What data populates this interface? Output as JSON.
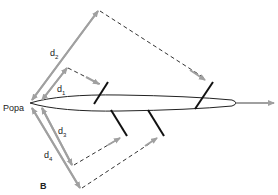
{
  "figure": {
    "panel_label": "B",
    "stern_label": "Popa",
    "distance_labels": [
      {
        "id": "d1",
        "base": "d",
        "sub": "1"
      },
      {
        "id": "d2",
        "base": "d",
        "sub": "2"
      },
      {
        "id": "d3",
        "base": "d",
        "sub": "3"
      },
      {
        "id": "d4",
        "base": "d",
        "sub": "4"
      }
    ]
  },
  "colors": {
    "arrow_gray": "#a0a0a0",
    "line_black": "#111111",
    "dash": "#333333"
  }
}
